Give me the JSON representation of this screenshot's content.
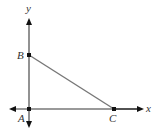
{
  "figure": {
    "type": "coordinate-geometry-triangle",
    "axes": {
      "x_label": "x",
      "y_label": "y",
      "axis_color": "#777777"
    },
    "points": [
      {
        "name": "A",
        "label": "A",
        "px": [
          29,
          109
        ]
      },
      {
        "name": "B",
        "label": "B",
        "px": [
          29,
          55
        ]
      },
      {
        "name": "C",
        "label": "C",
        "px": [
          114,
          109
        ]
      }
    ],
    "segments": [
      {
        "from": "B",
        "to": "C",
        "color": "#777777"
      }
    ],
    "colors": {
      "axis": "#777777",
      "point": "#111111",
      "arrowhead": "#111111",
      "label": "#333333"
    }
  }
}
